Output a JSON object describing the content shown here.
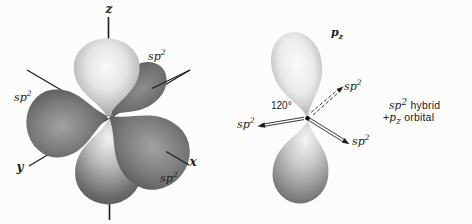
{
  "colors": {
    "background": "#fcfcfb",
    "ink": "#1c1c1c",
    "lobe_light": "#f5f5f5",
    "lobe_mid": "#9c9c9c",
    "lobe_dark": "#4e4e4e"
  },
  "left_diagram": {
    "axis_labels": {
      "z": "z",
      "y": "y",
      "x": "x"
    },
    "hybrid_label": {
      "base": "sp",
      "sup": "2"
    }
  },
  "right_diagram": {
    "p_orbital_label": {
      "base": "p",
      "sub": "z"
    },
    "hybrid_label": {
      "base": "sp",
      "sup": "2"
    },
    "angle_label": "120°"
  },
  "caption": {
    "hybrid_base": "sp",
    "hybrid_sup": "2",
    "line1_text": " hybrid",
    "plus": "+",
    "p_base": "p",
    "p_sub": "z",
    "line2_text": " orbital"
  }
}
